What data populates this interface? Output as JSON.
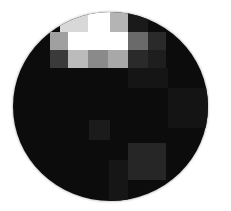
{
  "image": {
    "description": "Circular crop of a heavily pixelated grayscale image with bright blocks near the top",
    "shape": "circle",
    "background_color": "#ffffff",
    "disc_base_color": "#0c0c0c"
  },
  "grid": {
    "origin_x": 13,
    "origin_y": 12,
    "cells": [
      {
        "x": 47,
        "y": 0,
        "w": 28,
        "h": 20,
        "color": "#d8d8d8"
      },
      {
        "x": 75,
        "y": 0,
        "w": 22,
        "h": 20,
        "color": "#ffffff"
      },
      {
        "x": 97,
        "y": 0,
        "w": 18,
        "h": 20,
        "color": "#b4b4b4"
      },
      {
        "x": 115,
        "y": 0,
        "w": 20,
        "h": 20,
        "color": "#1a1a1a"
      },
      {
        "x": 37,
        "y": 20,
        "w": 18,
        "h": 18,
        "color": "#a0a0a0"
      },
      {
        "x": 55,
        "y": 20,
        "w": 60,
        "h": 18,
        "color": "#ffffff"
      },
      {
        "x": 115,
        "y": 20,
        "w": 20,
        "h": 18,
        "color": "#6a6a6a"
      },
      {
        "x": 135,
        "y": 20,
        "w": 18,
        "h": 18,
        "color": "#2a2a2a"
      },
      {
        "x": 37,
        "y": 38,
        "w": 18,
        "h": 18,
        "color": "#3a3a3a"
      },
      {
        "x": 55,
        "y": 38,
        "w": 20,
        "h": 18,
        "color": "#bbbbbb"
      },
      {
        "x": 75,
        "y": 38,
        "w": 20,
        "h": 18,
        "color": "#8a8a8a"
      },
      {
        "x": 95,
        "y": 38,
        "w": 20,
        "h": 18,
        "color": "#a8a8a8"
      },
      {
        "x": 115,
        "y": 38,
        "w": 20,
        "h": 18,
        "color": "#2a2a2a"
      },
      {
        "x": 135,
        "y": 38,
        "w": 18,
        "h": 18,
        "color": "#1e1e1e"
      },
      {
        "x": 115,
        "y": 56,
        "w": 40,
        "h": 20,
        "color": "#151515"
      },
      {
        "x": 155,
        "y": 76,
        "w": 40,
        "h": 40,
        "color": "#141414"
      },
      {
        "x": 76,
        "y": 108,
        "w": 21,
        "h": 20,
        "color": "#1b1b1b"
      },
      {
        "x": 115,
        "y": 131,
        "w": 38,
        "h": 37,
        "color": "#262626"
      },
      {
        "x": 96,
        "y": 148,
        "w": 19,
        "h": 41,
        "color": "#161616"
      }
    ]
  }
}
